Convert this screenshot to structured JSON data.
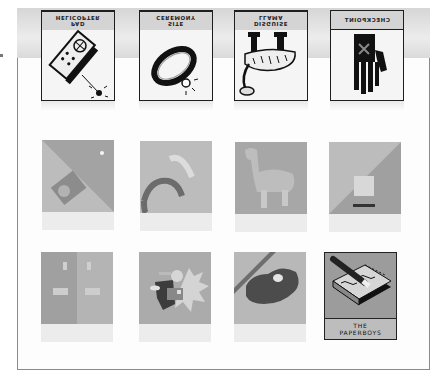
{
  "top_row": {
    "cards": [
      {
        "label_line1": "PAD",
        "label_line2": "HELICOPTER",
        "icon": "remote-control-icon"
      },
      {
        "label_line1": "SITE",
        "label_line2": "CEREMONY",
        "icon": "ring-icon"
      },
      {
        "label_line1": "DISGUISE",
        "label_line2": "LLAMA",
        "icon": "llama-icon"
      },
      {
        "label_line1": "CHECKPOINT",
        "label_line2": "",
        "icon": "hand-x-icon"
      }
    ]
  },
  "grid": {
    "tiles": [
      {
        "icon": "sticker-circle-icon"
      },
      {
        "icon": "ring-fragment-icon"
      },
      {
        "icon": "llama-silhouette-icon"
      },
      {
        "icon": "square-diagonal-icon"
      },
      {
        "icon": "door-panels-icon"
      },
      {
        "icon": "explosion-figure-icon"
      },
      {
        "icon": "dark-blob-icon"
      },
      {
        "icon": "notepad-pencil-icon",
        "caption_line1": "THE",
        "caption_line2": "PAPERBOYS",
        "selected": true
      }
    ]
  },
  "colors": {
    "tile_gray": "#a8a8a8",
    "tile_light": "#c4c4c4",
    "border_dark": "#1e1e1e"
  }
}
